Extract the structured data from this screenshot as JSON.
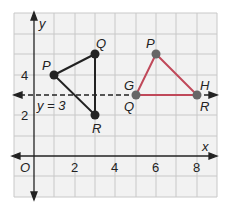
{
  "diagram": {
    "axes": {
      "x_label": "x",
      "y_label": "y",
      "origin_label": "O",
      "x_ticks": [
        "2",
        "4",
        "6",
        "8"
      ],
      "y_ticks": [
        "2",
        "4"
      ],
      "x_range": [
        -1,
        9
      ],
      "y_range": [
        -2,
        7
      ]
    },
    "line": {
      "label": "y = 3",
      "equation_y": 3,
      "left_point_label": "G",
      "right_point_label": "H",
      "style": "dashed"
    },
    "triangle_left": {
      "vertices": [
        {
          "label": "P",
          "x": 1,
          "y": 4
        },
        {
          "label": "Q",
          "x": 3,
          "y": 5
        },
        {
          "label": "R",
          "x": 3,
          "y": 2
        }
      ],
      "color": "#222222"
    },
    "triangle_right": {
      "vertices": [
        {
          "label": "P",
          "x": 6,
          "y": 5
        },
        {
          "label": "Q",
          "x": 5,
          "y": 3
        },
        {
          "label": "R",
          "x": 8,
          "y": 3
        }
      ],
      "color": "#c0495a"
    },
    "colors": {
      "grid_bg": "#f2f2f2",
      "grid_line": "#c8c8c8",
      "point_dark": "#222222",
      "point_gray": "#666666",
      "triangle_right_stroke": "#c0495a"
    }
  }
}
